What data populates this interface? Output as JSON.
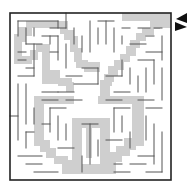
{
  "puzzle": {
    "type": "maze",
    "colors": {
      "background": "#ffffff",
      "path": "#cfcfcf",
      "wall": "#555555",
      "border": "#222222",
      "arrow": "#111111"
    },
    "border": {
      "x": 10,
      "y": 13,
      "w": 161,
      "h": 167
    },
    "entrance_arrow": {
      "points": "187,13 176,19 187,23",
      "direction": "left"
    },
    "exit_arrow": {
      "points": "175,22 187,27 175,31",
      "direction": "right"
    },
    "solution_path_rects": [
      [
        122,
        13,
        49,
        8
      ],
      [
        158,
        21,
        13,
        7
      ],
      [
        150,
        21,
        10,
        8
      ],
      [
        142,
        28,
        12,
        7
      ],
      [
        136,
        33,
        10,
        8
      ],
      [
        130,
        40,
        10,
        8
      ],
      [
        126,
        46,
        10,
        10
      ],
      [
        120,
        54,
        10,
        8
      ],
      [
        114,
        60,
        10,
        10
      ],
      [
        108,
        66,
        10,
        10
      ],
      [
        104,
        74,
        10,
        8
      ],
      [
        100,
        80,
        12,
        6
      ],
      [
        100,
        84,
        10,
        12
      ],
      [
        26,
        21,
        42,
        7
      ],
      [
        18,
        27,
        14,
        9
      ],
      [
        14,
        34,
        12,
        8
      ],
      [
        14,
        40,
        8,
        24
      ],
      [
        20,
        56,
        12,
        8
      ],
      [
        30,
        50,
        8,
        10
      ],
      [
        36,
        44,
        10,
        8
      ],
      [
        42,
        44,
        8,
        40
      ],
      [
        48,
        70,
        12,
        14
      ],
      [
        58,
        78,
        14,
        8
      ],
      [
        66,
        82,
        8,
        10
      ],
      [
        60,
        22,
        8,
        12
      ],
      [
        64,
        30,
        10,
        10
      ],
      [
        70,
        36,
        8,
        16
      ],
      [
        74,
        48,
        8,
        14
      ],
      [
        76,
        60,
        12,
        8
      ],
      [
        84,
        62,
        16,
        10
      ],
      [
        34,
        96,
        40,
        8
      ],
      [
        34,
        96,
        10,
        50
      ],
      [
        40,
        140,
        10,
        12
      ],
      [
        46,
        148,
        10,
        10
      ],
      [
        54,
        156,
        14,
        8
      ],
      [
        62,
        160,
        12,
        14
      ],
      [
        98,
        96,
        44,
        8
      ],
      [
        132,
        96,
        12,
        50
      ],
      [
        124,
        138,
        12,
        12
      ],
      [
        116,
        146,
        14,
        10
      ],
      [
        110,
        152,
        12,
        10
      ],
      [
        104,
        160,
        12,
        14
      ],
      [
        72,
        118,
        36,
        10
      ],
      [
        72,
        118,
        10,
        56
      ],
      [
        100,
        118,
        10,
        56
      ],
      [
        80,
        164,
        28,
        10
      ],
      [
        86,
        118,
        6,
        40
      ]
    ],
    "walls": [
      [
        18,
        21,
        18,
        36
      ],
      [
        18,
        21,
        58,
        21
      ],
      [
        26,
        28,
        26,
        44
      ],
      [
        34,
        28,
        34,
        36
      ],
      [
        50,
        28,
        66,
        28
      ],
      [
        58,
        21,
        58,
        28
      ],
      [
        66,
        13,
        66,
        28
      ],
      [
        26,
        44,
        42,
        44
      ],
      [
        18,
        52,
        26,
        52
      ],
      [
        18,
        60,
        26,
        60
      ],
      [
        34,
        44,
        34,
        76
      ],
      [
        26,
        68,
        34,
        68
      ],
      [
        18,
        76,
        34,
        76
      ],
      [
        50,
        36,
        50,
        44
      ],
      [
        42,
        36,
        58,
        36
      ],
      [
        58,
        36,
        58,
        60
      ],
      [
        50,
        52,
        58,
        52
      ],
      [
        66,
        44,
        66,
        68
      ],
      [
        74,
        28,
        74,
        44
      ],
      [
        82,
        36,
        82,
        52
      ],
      [
        90,
        21,
        90,
        52
      ],
      [
        98,
        21,
        114,
        21
      ],
      [
        106,
        21,
        106,
        44
      ],
      [
        98,
        28,
        98,
        44
      ],
      [
        114,
        28,
        114,
        52
      ],
      [
        122,
        28,
        130,
        28
      ],
      [
        122,
        36,
        122,
        44
      ],
      [
        138,
        28,
        150,
        28
      ],
      [
        130,
        44,
        146,
        44
      ],
      [
        146,
        36,
        154,
        36
      ],
      [
        154,
        28,
        162,
        28
      ],
      [
        162,
        36,
        162,
        60
      ],
      [
        146,
        52,
        162,
        52
      ],
      [
        138,
        60,
        154,
        60
      ],
      [
        154,
        60,
        154,
        84
      ],
      [
        146,
        68,
        146,
        92
      ],
      [
        138,
        76,
        138,
        92
      ],
      [
        162,
        68,
        162,
        100
      ],
      [
        66,
        76,
        82,
        76
      ],
      [
        74,
        84,
        98,
        84
      ],
      [
        98,
        68,
        98,
        84
      ],
      [
        82,
        68,
        98,
        68
      ],
      [
        106,
        76,
        122,
        76
      ],
      [
        122,
        60,
        122,
        76
      ],
      [
        130,
        68,
        130,
        84
      ],
      [
        114,
        92,
        130,
        92
      ],
      [
        58,
        92,
        74,
        92
      ],
      [
        42,
        92,
        58,
        92
      ],
      [
        18,
        84,
        18,
        140
      ],
      [
        26,
        84,
        26,
        124
      ],
      [
        10,
        116,
        18,
        116
      ],
      [
        34,
        108,
        34,
        124
      ],
      [
        26,
        132,
        34,
        132
      ],
      [
        26,
        132,
        26,
        148
      ],
      [
        18,
        156,
        42,
        156
      ],
      [
        26,
        164,
        42,
        164
      ],
      [
        34,
        172,
        58,
        172
      ],
      [
        50,
        108,
        66,
        108
      ],
      [
        50,
        108,
        50,
        132
      ],
      [
        58,
        116,
        58,
        140
      ],
      [
        42,
        124,
        50,
        124
      ],
      [
        66,
        124,
        66,
        140
      ],
      [
        58,
        148,
        74,
        148
      ],
      [
        82,
        124,
        98,
        124
      ],
      [
        90,
        124,
        90,
        164
      ],
      [
        82,
        156,
        82,
        172
      ],
      [
        98,
        140,
        98,
        156
      ],
      [
        114,
        108,
        130,
        108
      ],
      [
        114,
        108,
        114,
        132
      ],
      [
        122,
        116,
        122,
        132
      ],
      [
        106,
        140,
        122,
        140
      ],
      [
        130,
        132,
        130,
        148
      ],
      [
        146,
        108,
        162,
        108
      ],
      [
        146,
        116,
        146,
        140
      ],
      [
        154,
        124,
        154,
        164
      ],
      [
        162,
        132,
        162,
        172
      ],
      [
        138,
        156,
        154,
        156
      ],
      [
        130,
        164,
        146,
        164
      ],
      [
        146,
        172,
        162,
        172
      ],
      [
        114,
        164,
        122,
        164
      ],
      [
        114,
        172,
        130,
        172
      ],
      [
        138,
        100,
        154,
        100
      ],
      [
        106,
        100,
        122,
        100
      ],
      [
        66,
        100,
        82,
        100
      ],
      [
        42,
        100,
        58,
        100
      ]
    ]
  }
}
